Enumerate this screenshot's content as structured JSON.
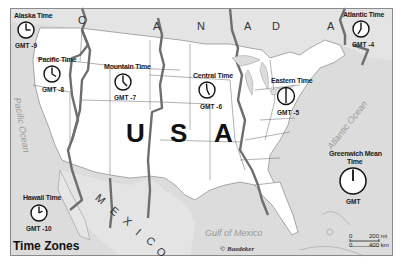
{
  "map": {
    "title": "Time Zones",
    "credit": "© Baedeker",
    "country_labels": {
      "canada": [
        "C",
        "A",
        "N",
        "A",
        "D",
        "A"
      ],
      "usa": [
        "U",
        "S",
        "A"
      ],
      "mexico": [
        "M",
        "E",
        "X",
        "I",
        "C",
        "O"
      ]
    },
    "water_labels": {
      "pacific": "Pacific Ocean",
      "atlantic": "Atlantic Ocean",
      "gulf": "Gulf of Mexico"
    },
    "time_zones": [
      {
        "id": "alaska",
        "name": "Alaska Time",
        "offset": "GMT -9",
        "hour": 3
      },
      {
        "id": "pacific",
        "name": "Pacific Time",
        "offset": "GMT -8",
        "hour": 4
      },
      {
        "id": "mountain",
        "name": "Mountain Time",
        "offset": "GMT -7",
        "hour": 5
      },
      {
        "id": "central",
        "name": "Central Time",
        "offset": "GMT -6",
        "hour": 5.5
      },
      {
        "id": "eastern",
        "name": "Eastern Time",
        "offset": "GMT -5",
        "hour": 6
      },
      {
        "id": "atlantic",
        "name": "Atlantic Time",
        "offset": "GMT -4",
        "hour": 7
      },
      {
        "id": "gmt",
        "name_line1": "Greenwich Mean",
        "name_line2": "Time",
        "offset": "GMT",
        "hour": 12
      },
      {
        "id": "hawaii",
        "name": "Hawaii Time",
        "offset": "GMT -10",
        "hour": 2
      }
    ],
    "scale": {
      "zero": "0",
      "miles": "200 mi",
      "km": "400 km"
    },
    "colors": {
      "land_us": "#ffffff",
      "land_foreign": "#e2e2e2",
      "water": "#dcdcdc",
      "zone_boundary": "#6e6e6e",
      "state_line": "#555555"
    }
  }
}
